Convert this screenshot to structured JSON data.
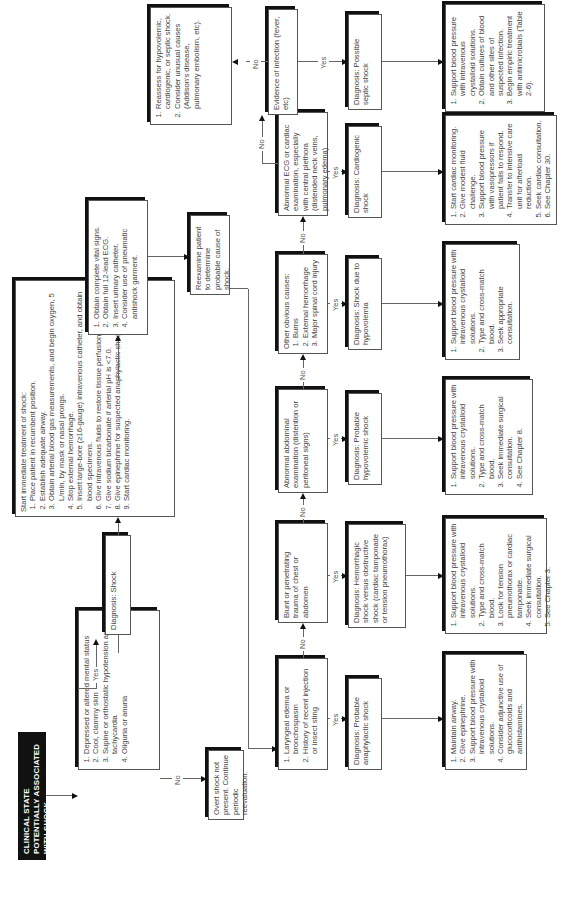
{
  "orientation": "rotated-90-ccw",
  "title": "CLINICAL STATE POTENTIALLY ASSOCIATED WITH SHOCK",
  "criteria": {
    "items": [
      "Depressed or altered mental status",
      "Cool, clammy skin",
      "Supine or orthostatic hypotension and tachycardia",
      "Oliguria or anuria"
    ]
  },
  "no_shock": "Overt shock not present. Continue periodic reevaluation.",
  "diagnosis_shock": "Diagnosis: Shock",
  "treatment": {
    "heading": "Start immediate treatment of shock:",
    "items": [
      "Place patient in recumbent position.",
      "Establish adequate airway.",
      "Obtain arterial blood gas measurements, and begin oxygen, 5 L/min, by mask or nasal prongs.",
      "Stop external hemorrhage.",
      "Insert large-bore (≥16-gauge) intravenous catheter, and obtain blood specimens.",
      "Give intravenous fluids to restore tissue perfusion.",
      "Give sodium bicarbonate if arterial pH is <7.0.",
      "Give epinephrine for suspected anaphylactic shock.",
      "Start cardiac monitoring."
    ]
  },
  "vitals": {
    "items": [
      "Obtain complete vital signs.",
      "Obtain full 12-lead ECG.",
      "Insert urinary catheter.",
      "Consider use of pneumatic antishock garment."
    ]
  },
  "reexamine": "Reexamine patient to determine probable cause of shock.",
  "reassess": {
    "items": [
      "Reassess for hypovolemic, cardiogenic, or septic shock.",
      "Consider unusual causes (Addison's disease, pulmonary embolism, etc)."
    ]
  },
  "labels": {
    "yes": "Yes",
    "no": "No"
  },
  "decisions": [
    {
      "id": "anaphylaxis",
      "items": [
        "Laryngeal edema or bronchospasm",
        "History of recent injection or insect sting"
      ]
    },
    {
      "id": "trauma",
      "text": "Blunt or penetrating trauma of chest or abdomen"
    },
    {
      "id": "abdominal",
      "text": "Abnormal abdominal examination (distention or peritoneal signs)"
    },
    {
      "id": "other",
      "heading": "Other obvious causes:",
      "items": [
        "Burns",
        "External hemorrhage",
        "Major spinal cord injury"
      ]
    },
    {
      "id": "cardiac",
      "text": "Abnormal ECG or cardiac examination, especially with central plethora (distended neck veins, pulmonary edema)"
    },
    {
      "id": "infection",
      "text": "Evidence of infection (fever, etc)"
    }
  ],
  "diagnoses": [
    "Diagnosis: Probable anaphylactic shock",
    "Diagnosis: Hemorrhagic shock versus obstructive shock (cardiac tamponade or tension pneumothorax)",
    "Diagnosis: Probable hypovolemic shock",
    "Diagnosis: Shock due to hypovolemia",
    "Diagnosis: Cardiogenic shock",
    "Diagnosis: Possible septic shock"
  ],
  "treatments": [
    [
      "Maintain airway.",
      "Give epinephrine.",
      "Support blood pressure with intravenous crystalloid solutions.",
      "Consider adjunctive use of glucocorticoids and antihistamines."
    ],
    [
      "Support blood pressure with intravenous crystalloid solutions.",
      "Type and cross-match blood.",
      "Look for tension pneumothorax or cardiac tamponade.",
      "Seek immediate surgical consultation.",
      "See Chapter 3."
    ],
    [
      "Support blood pressure with intravenous crystalloid solutions.",
      "Type and cross-match blood.",
      "Seek immediate surgical consultation.",
      "See Chapter 8."
    ],
    [
      "Support blood pressure with intravenous crystalloid solutions.",
      "Type and cross-match blood.",
      "Seek appropriate consultation."
    ],
    [
      "Start cardiac monitoring.",
      "Give modest fluid challenge.",
      "Support blood pressure with vasopressors if patient fails to respond.",
      "Transfer to intensive care unit for afterload reduction.",
      "Seek cardiac consultation.",
      "See Chapter 30."
    ],
    [
      "Support blood pressure with intravenous crystalloid solutions.",
      "Obtain cultures of blood and other sites of suspected infection.",
      "Begin empiric treatment with antimicrobials (Table 2-6)."
    ]
  ]
}
